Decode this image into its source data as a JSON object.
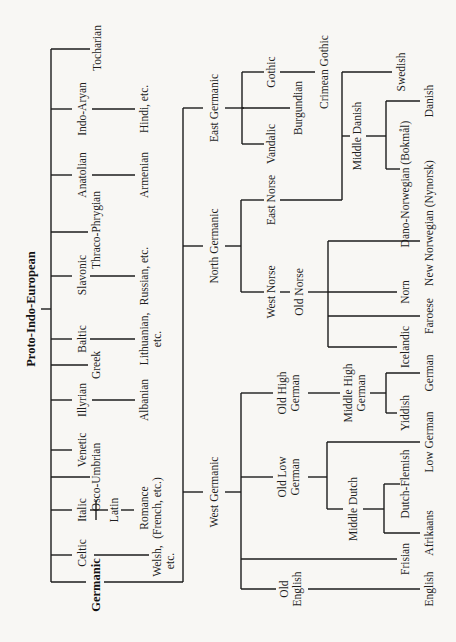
{
  "diagram": {
    "title": "Proto-Indo-European",
    "orientation": "rotated 90° counter-clockwise (root on the left, text reads bottom-to-top)",
    "branches": {
      "tocharian": "Tocharian",
      "indo_aryan": "Indo-Aryan",
      "hindi": "Hindi, etc.",
      "anatolian": "Anatolian",
      "armenian": "Armenian",
      "thraco_phrygian": "Thraco-Phrygian",
      "slavonic": "Slavonic",
      "russian": "Russian, etc.",
      "baltic": "Baltic",
      "lithuanian_1": "Lithuanian,",
      "lithuanian_2": "etc.",
      "greek": "Greek",
      "illyrian": "Illyrian",
      "albanian": "Albanian",
      "venetic": "Venetic",
      "osco_umbrian": "Osco-Umbrian",
      "italic": "Italic",
      "latin": "Latin",
      "romance_1": "Romance",
      "romance_2": "(French, etc.)",
      "celtic": "Celtic",
      "welsh_1": "Welsh,",
      "welsh_2": "etc.",
      "germanic": "Germanic"
    },
    "germanic": {
      "east_germanic": "East Germanic",
      "gothic": "Gothic",
      "crimean_gothic": "Crimean Gothic",
      "burgundian": "Burgundian",
      "vandalic": "Vandalic",
      "north_germanic": "North Germanic",
      "east_norse": "East Norse",
      "swedish": "Swedish",
      "middle_danish": "Middle Danish",
      "danish": "Danish",
      "dano_norwegian": "Dano-Norwegian (Bokmål)",
      "west_norse": "West Norse",
      "old_norse": "Old Norse",
      "new_norwegian": "New Norwegian (Nynorsk)",
      "norn": "Norn",
      "faroese": "Faroese",
      "icelandic": "Icelandic",
      "west_germanic": "West Germanic",
      "old_high_german_1": "Old High",
      "old_high_german_2": "German",
      "middle_high_german_1": "Middle High",
      "middle_high_german_2": "German",
      "german": "German",
      "yiddish": "Yiddish",
      "old_low_german_1": "Old Low",
      "old_low_german_2": "German",
      "low_german": "Low German",
      "middle_dutch": "Middle Dutch",
      "dutch_flemish": "Dutch-Flemish",
      "afrikaans": "Afrikaans",
      "frisian": "Frisian",
      "old_english_1": "Old",
      "old_english_2": "English",
      "english": "English"
    }
  }
}
